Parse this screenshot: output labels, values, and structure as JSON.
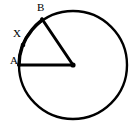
{
  "figure": {
    "kind": "circle-geometry-diagram",
    "background_color": "#ffffff",
    "stroke_color": "#000000",
    "width": 130,
    "height": 131
  },
  "circle": {
    "name": "circle-outline",
    "center_x": 73,
    "center_y": 65,
    "radius": 54,
    "stroke_width": 2.4
  },
  "center_point": {
    "name": "circle-center",
    "x": 73,
    "y": 65,
    "dot_radius": 2.6
  },
  "points": {
    "A": {
      "label": "A",
      "x": 19,
      "y": 65,
      "angle_deg": 180
    },
    "B": {
      "label": "B",
      "x": 42,
      "y": 19,
      "angle_deg": 140
    },
    "X": {
      "label": "X",
      "x": 23,
      "y": 45,
      "angle_deg": 158
    }
  },
  "radii": [
    {
      "name": "radius-to-A",
      "from": "center",
      "to": "A",
      "stroke_width": 3.0
    },
    {
      "name": "radius-to-B",
      "from": "center",
      "to": "B",
      "stroke_width": 3.0
    }
  ],
  "arc": {
    "name": "arc-A-to-B",
    "from": "A",
    "to": "B",
    "highlighted": true,
    "stroke_width": 3.2
  },
  "tick_mark": {
    "name": "arc-point-marker-X",
    "x": 23,
    "y": 45,
    "radius": 2.3
  },
  "labels": {
    "B": "B",
    "X": "X",
    "A": "A"
  }
}
